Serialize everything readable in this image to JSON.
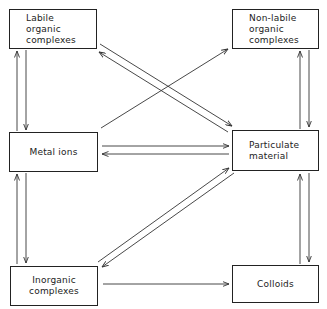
{
  "diagram": {
    "nodes": [
      {
        "id": "labile",
        "label": "Labile\norganic\ncomplexes",
        "x": 9,
        "y": 9,
        "w": 88,
        "h": 40,
        "align": "left"
      },
      {
        "id": "nonlabile",
        "label": "Non-labile\norganic\ncomplexes",
        "x": 232,
        "y": 9,
        "w": 87,
        "h": 40,
        "align": "left"
      },
      {
        "id": "metal",
        "label": "Metal ions",
        "x": 9,
        "y": 132,
        "w": 89,
        "h": 40,
        "align": "center"
      },
      {
        "id": "particulate",
        "label": "Particulate\nmaterial",
        "x": 232,
        "y": 130,
        "w": 87,
        "h": 41,
        "align": "left"
      },
      {
        "id": "inorganic",
        "label": "Inorganic\ncomplexes",
        "x": 10,
        "y": 266,
        "w": 88,
        "h": 40,
        "align": "center"
      },
      {
        "id": "colloids",
        "label": "Colloids",
        "x": 232,
        "y": 265,
        "w": 87,
        "h": 38,
        "align": "center"
      }
    ],
    "edges": [
      {
        "from": "metal",
        "to": "labile",
        "x1": 17,
        "y1": 131,
        "x2": 17,
        "y2": 51
      },
      {
        "from": "labile",
        "to": "metal",
        "x1": 26,
        "y1": 50,
        "x2": 26,
        "y2": 130
      },
      {
        "from": "inorganic",
        "to": "metal",
        "x1": 17,
        "y1": 264,
        "x2": 17,
        "y2": 174
      },
      {
        "from": "metal",
        "to": "inorganic",
        "x1": 26,
        "y1": 173,
        "x2": 26,
        "y2": 263
      },
      {
        "from": "particulate",
        "to": "nonlabile",
        "x1": 300,
        "y1": 129,
        "x2": 300,
        "y2": 51
      },
      {
        "from": "nonlabile",
        "to": "particulate",
        "x1": 309,
        "y1": 50,
        "x2": 309,
        "y2": 127
      },
      {
        "from": "colloids",
        "to": "particulate",
        "x1": 300,
        "y1": 264,
        "x2": 300,
        "y2": 174
      },
      {
        "from": "particulate",
        "to": "colloids",
        "x1": 309,
        "y1": 173,
        "x2": 309,
        "y2": 262
      },
      {
        "from": "labile",
        "to": "particulate",
        "x1": 100,
        "y1": 44,
        "x2": 232,
        "y2": 126
      },
      {
        "from": "particulate",
        "to": "labile",
        "x1": 228,
        "y1": 132,
        "x2": 99,
        "y2": 52
      },
      {
        "from": "metal",
        "to": "nonlabile",
        "x1": 101,
        "y1": 128,
        "x2": 228,
        "y2": 49
      },
      {
        "from": "metal",
        "to": "particulate",
        "x1": 102,
        "y1": 146,
        "x2": 229,
        "y2": 146
      },
      {
        "from": "particulate",
        "to": "metal",
        "x1": 229,
        "y1": 154,
        "x2": 102,
        "y2": 154
      },
      {
        "from": "inorganic",
        "to": "particulate",
        "x1": 98,
        "y1": 262,
        "x2": 229,
        "y2": 168
      },
      {
        "from": "particulate",
        "to": "inorganic",
        "x1": 234,
        "y1": 173,
        "x2": 102,
        "y2": 267
      },
      {
        "from": "inorganic",
        "to": "colloids",
        "x1": 103,
        "y1": 284,
        "x2": 229,
        "y2": 284
      }
    ]
  }
}
